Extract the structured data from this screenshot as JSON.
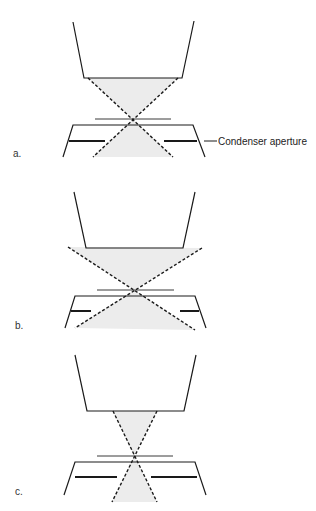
{
  "figure": {
    "colors": {
      "line": "#1a1a1a",
      "thin_line": "#3a3a3a",
      "beam_fill": "#ececec",
      "dash": "#1a1a1a"
    },
    "annotation": {
      "text": "Condenser aperture",
      "leader": [
        204,
        141,
        217,
        141
      ],
      "x": 218,
      "y": 145
    },
    "panels": [
      {
        "id": "a",
        "letter": "a.",
        "letter_pos": [
          13,
          157
        ],
        "objective": [
          [
            73,
            22
          ],
          [
            84,
            78
          ],
          [
            182,
            78
          ],
          [
            194,
            21
          ]
        ],
        "beam_top": [
          [
            88,
            78
          ],
          [
            178,
            78
          ],
          [
            133,
            119
          ]
        ],
        "beam_bottom": [
          [
            133,
            119
          ],
          [
            93,
            157
          ],
          [
            173,
            157
          ]
        ],
        "rays": [
          [
            [
              88,
              78
            ],
            [
              173,
              157
            ]
          ],
          [
            [
              178,
              78
            ],
            [
              93,
              157
            ]
          ]
        ],
        "crossover_line": [
          95,
          119,
          171,
          119
        ],
        "condenser": [
          [
            63,
            157
          ],
          [
            73,
            125
          ],
          [
            193,
            125
          ],
          [
            205,
            157
          ]
        ],
        "aperture_left": [
          69,
          141,
          105,
          141
        ],
        "aperture_right": [
          164,
          141,
          197,
          141
        ],
        "show_annotation": true
      },
      {
        "id": "b",
        "letter": "b.",
        "letter_pos": [
          15,
          329
        ],
        "objective": [
          [
            74,
            192
          ],
          [
            86,
            248
          ],
          [
            183,
            248
          ],
          [
            195,
            192
          ]
        ],
        "beam_top": [
          [
            68,
            247
          ],
          [
            202,
            248
          ],
          [
            134,
            290
          ]
        ],
        "beam_bottom": [
          [
            134,
            290
          ],
          [
            75,
            328
          ],
          [
            195,
            330
          ]
        ],
        "rays": [
          [
            [
              68,
              247
            ],
            [
              195,
              330
            ]
          ],
          [
            [
              202,
              248
            ],
            [
              75,
              328
            ]
          ]
        ],
        "crossover_line": [
          97,
          290,
          174,
          290
        ],
        "condenser": [
          [
            65,
            328
          ],
          [
            75,
            296
          ],
          [
            195,
            296
          ],
          [
            206,
            328
          ]
        ],
        "aperture_left": [
          71,
          311,
          91,
          311
        ],
        "aperture_right": [
          180,
          311,
          199,
          311
        ],
        "show_annotation": false
      },
      {
        "id": "c",
        "letter": "c.",
        "letter_pos": [
          15,
          495
        ],
        "objective": [
          [
            75,
            355
          ],
          [
            87,
            411
          ],
          [
            184,
            411
          ],
          [
            196,
            355
          ]
        ],
        "beam_top": [
          [
            113,
            411
          ],
          [
            157,
            411
          ],
          [
            134,
            456
          ]
        ],
        "beam_bottom": [
          [
            134,
            456
          ],
          [
            112,
            502
          ],
          [
            157,
            502
          ]
        ],
        "rays": [
          [
            [
              113,
              411
            ],
            [
              157,
              502
            ]
          ],
          [
            [
              157,
              411
            ],
            [
              112,
              502
            ]
          ]
        ],
        "crossover_line": [
          97,
          456,
          173,
          456
        ],
        "condenser": [
          [
            64,
            495
          ],
          [
            75,
            462
          ],
          [
            195,
            462
          ],
          [
            206,
            495
          ]
        ],
        "aperture_left": [
          75,
          477,
          117,
          477
        ],
        "aperture_right": [
          151,
          477,
          197,
          477
        ],
        "show_annotation": false
      }
    ]
  }
}
